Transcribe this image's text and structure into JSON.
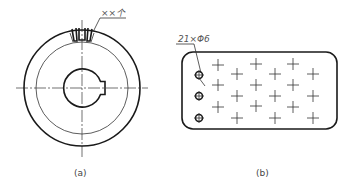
{
  "figure": {
    "panels": [
      {
        "id": "a",
        "caption": "(a)",
        "annotation": "××个",
        "description": "Circular disc with slotted rim and keyed bore"
      },
      {
        "id": "b",
        "caption": "(b)",
        "annotation": "21×Φ6",
        "description": "Rounded rectangular plate with 21 holes (3 drawn, 18 marked by centerlines)"
      }
    ]
  },
  "colors": {
    "line": "#1a1a1a",
    "thin_line": "#333333",
    "text": "#555555",
    "background": "#ffffff"
  }
}
